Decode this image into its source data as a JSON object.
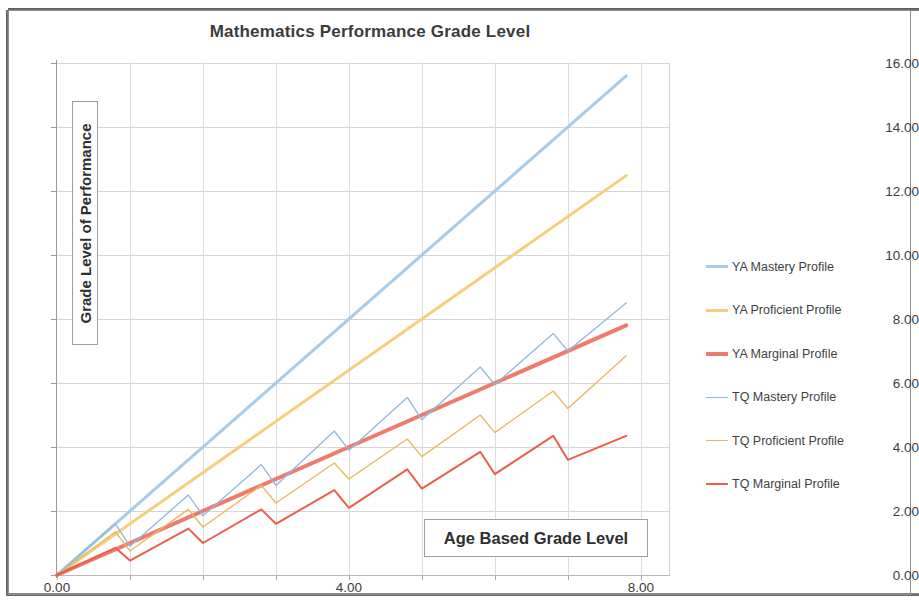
{
  "chart_data": {
    "type": "line",
    "title": "Mathematics Performance Grade Level",
    "xlabel": "Age Based Grade Level",
    "ylabel": "Grade Level of Performance",
    "xlim": [
      0,
      8.4
    ],
    "ylim": [
      0,
      16
    ],
    "xticks": [
      0,
      4,
      8
    ],
    "xtick_labels": [
      "0.00",
      "4.00",
      "8.00"
    ],
    "x_minor_ticks": [
      0,
      1,
      2,
      3,
      4,
      5,
      6,
      7,
      8
    ],
    "yticks": [
      0,
      2,
      4,
      6,
      8,
      10,
      12,
      14,
      16
    ],
    "ytick_labels": [
      "0.00",
      "2.00",
      "4.00",
      "6.00",
      "8.00",
      "10.00",
      "12.00",
      "14.00",
      "16.00"
    ],
    "grid": true,
    "legend_position": "right",
    "series": [
      {
        "name": "YA Mastery Profile",
        "color": "#A7CCEA",
        "width": 3,
        "style": "linear",
        "x": [
          0,
          7.8
        ],
        "values": [
          0,
          15.6
        ]
      },
      {
        "name": "YA Proficient Profile",
        "color": "#F5CE7E",
        "width": 3,
        "style": "linear",
        "x": [
          0,
          7.8
        ],
        "values": [
          0,
          12.48
        ]
      },
      {
        "name": "YA Marginal Profile",
        "color": "#F07B6C",
        "width": 4,
        "style": "linear",
        "x": [
          0,
          7.8
        ],
        "values": [
          0,
          7.8
        ]
      },
      {
        "name": "TQ Mastery Profile",
        "color": "#8FB8DC",
        "width": 1.3,
        "style": "sawtooth",
        "x": [
          0,
          0.8,
          1,
          1.8,
          2,
          2.8,
          3,
          3.8,
          4,
          4.8,
          5,
          5.8,
          6,
          6.8,
          7,
          7.8
        ],
        "values": [
          0,
          1.6,
          0.9,
          2.5,
          1.85,
          3.45,
          2.8,
          4.5,
          3.9,
          5.55,
          4.85,
          6.5,
          5.95,
          7.55,
          7.0,
          8.5
        ]
      },
      {
        "name": "TQ Proficient Profile",
        "color": "#E8B75A",
        "width": 1.3,
        "style": "sawtooth",
        "x": [
          0,
          0.8,
          1,
          1.8,
          2,
          2.8,
          3,
          3.8,
          4,
          4.8,
          5,
          5.8,
          6,
          6.8,
          7,
          7.8
        ],
        "values": [
          0,
          1.35,
          0.75,
          2.05,
          1.5,
          2.8,
          2.25,
          3.5,
          3.0,
          4.25,
          3.7,
          5.0,
          4.45,
          5.75,
          5.2,
          6.85
        ]
      },
      {
        "name": "TQ Marginal Profile",
        "color": "#E8604C",
        "width": 2,
        "style": "sawtooth",
        "x": [
          0,
          0.8,
          1,
          1.8,
          2,
          2.8,
          3,
          3.8,
          4,
          4.8,
          5,
          5.8,
          6,
          6.8,
          7,
          7.8
        ],
        "values": [
          0,
          0.85,
          0.45,
          1.45,
          1.0,
          2.05,
          1.6,
          2.65,
          2.1,
          3.3,
          2.7,
          3.85,
          3.15,
          4.35,
          3.6,
          4.35
        ]
      }
    ]
  },
  "legend": {
    "items": [
      {
        "label": "YA Mastery Profile",
        "color": "#A7CCEA",
        "thickness": 3
      },
      {
        "label": "YA Proficient Profile",
        "color": "#F5CE7E",
        "thickness": 3
      },
      {
        "label": "YA Marginal Profile",
        "color": "#F07B6C",
        "thickness": 4
      },
      {
        "label": "TQ Mastery Profile",
        "color": "#8FB8DC",
        "thickness": 1.4
      },
      {
        "label": "TQ Proficient Profile",
        "color": "#E8B75A",
        "thickness": 1.4
      },
      {
        "label": "TQ Marginal Profile",
        "color": "#E8604C",
        "thickness": 2
      }
    ]
  }
}
